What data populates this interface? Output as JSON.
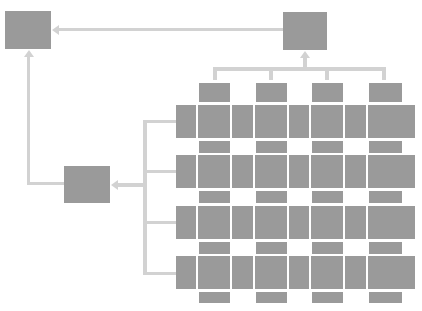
{
  "diagram": {
    "type": "block-hierarchy",
    "colors": {
      "block": "#9a9a9a",
      "connector": "#d2d2d2",
      "background": "#ffffff"
    },
    "nodes": [
      {
        "id": "top-left",
        "label": ""
      },
      {
        "id": "top-right",
        "label": ""
      },
      {
        "id": "middle-left",
        "label": ""
      }
    ],
    "grid": {
      "rows": 4,
      "columns": 4
    },
    "edges": [
      {
        "from": "top-right",
        "to": "top-left"
      },
      {
        "from": "grid-columns",
        "to": "top-right"
      },
      {
        "from": "grid-rows",
        "to": "middle-left"
      },
      {
        "from": "middle-left",
        "to": "top-left"
      }
    ]
  }
}
